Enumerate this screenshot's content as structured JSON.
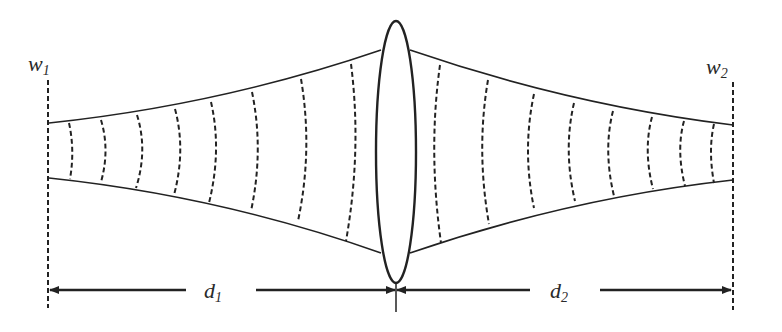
{
  "diagram": {
    "labels": {
      "w1": {
        "base": "w",
        "sub": "1"
      },
      "w2": {
        "base": "w",
        "sub": "2"
      },
      "d1": {
        "base": "d",
        "sub": "1"
      },
      "d2": {
        "base": "d",
        "sub": "2"
      }
    },
    "elements": {
      "left_waist_plane": "dashed vertical line",
      "right_waist_plane": "dashed vertical line",
      "lens": "thin convex lens (ellipse)",
      "beam_envelope": "solid curves",
      "wavefronts_left_count": 9,
      "wavefronts_right_count": 9,
      "dimension_arrows": [
        "d1",
        "d2"
      ]
    },
    "colors": {
      "stroke": "#222222",
      "background": "#ffffff"
    }
  }
}
